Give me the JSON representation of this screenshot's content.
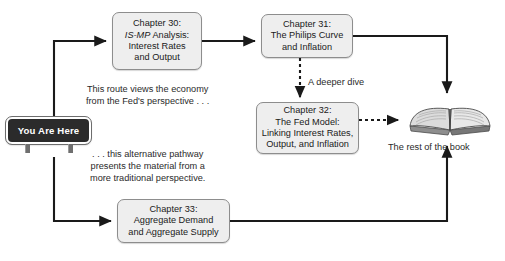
{
  "figure": {
    "top_cut_text": "",
    "boxes": {
      "ch30": {
        "line1": "Chapter 30:",
        "line2_italic": "IS-MP",
        "line2_rest": " Analysis:",
        "line3": "Interest Rates",
        "line4": "and Output"
      },
      "ch31": {
        "line1": "Chapter 31:",
        "line2": "The Philips Curve",
        "line3": "and Inflation"
      },
      "ch32": {
        "line1": "Chapter 32:",
        "line2": "The Fed Model:",
        "line3": "Linking Interest Rates,",
        "line4": "Output, and Inflation"
      },
      "ch33": {
        "line1": "Chapter 33:",
        "line2": "Aggregate Demand",
        "line3": "and Aggregate Supply"
      }
    },
    "sign": {
      "label": "You Are Here"
    },
    "notes": {
      "fed_route_line1": "This route views the economy",
      "fed_route_line2": "from the Fed's perspective . . .",
      "alt_route_line1": ". . . this alternative pathway",
      "alt_route_line2": "presents the material from a",
      "alt_route_line3": "more traditional perspective.",
      "deeper_dive": "A deeper dive",
      "book_caption": "The rest of the book"
    },
    "colors": {
      "box_fill": "#eeeeee",
      "box_border": "#8d8d8d",
      "sign_fill": "#2b2b2b",
      "sign_text": "#ffffff",
      "connector": "#1a1a1a",
      "text": "#1a1a1a",
      "page_background": "#ffffff"
    }
  }
}
